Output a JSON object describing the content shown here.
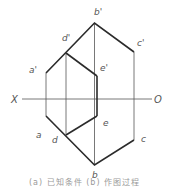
{
  "diagram": {
    "axis": {
      "left_label": "X",
      "right_label": "O"
    },
    "front_view_labels": {
      "a_prime": "a'",
      "b_prime": "b'",
      "c_prime": "c'",
      "d_prime": "d'",
      "e_prime": "e'"
    },
    "top_view_labels": {
      "a": "a",
      "b": "b",
      "c": "c",
      "d": "d",
      "e": "e"
    },
    "caption": "(a) 已知条件   (b) 作图过程",
    "colors": {
      "line": "#2b2b2b",
      "thin_line": "#666666",
      "label": "#555555"
    }
  }
}
